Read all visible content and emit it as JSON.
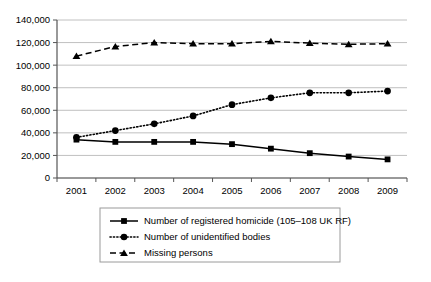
{
  "chart_data": {
    "type": "line",
    "title": "",
    "xlabel": "",
    "ylabel": "",
    "categories": [
      "2001",
      "2002",
      "2003",
      "2004",
      "2005",
      "2006",
      "2007",
      "2008",
      "2009"
    ],
    "ylim": [
      0,
      140000
    ],
    "ytick_values": [
      0,
      20000,
      40000,
      60000,
      80000,
      100000,
      120000,
      140000
    ],
    "ytick_labels": [
      "0",
      "20,000",
      "40,000",
      "60,000",
      "80,000",
      "100,000",
      "120,000",
      "140,000"
    ],
    "grid": true,
    "legend_position": "bottom",
    "series": [
      {
        "name": "Number of registered homicide (105–108 UK RF)",
        "marker": "square",
        "line_style": "solid",
        "color": "#000000",
        "values": [
          34000,
          32000,
          32000,
          32000,
          30000,
          26000,
          22000,
          19000,
          16500
        ]
      },
      {
        "name": "Number of unidentified bodies",
        "marker": "circle",
        "line_style": "dotted",
        "color": "#000000",
        "values": [
          36000,
          42000,
          48000,
          55000,
          65000,
          71000,
          75500,
          75500,
          77000
        ]
      },
      {
        "name": "Missing persons",
        "marker": "triangle",
        "line_style": "dashed",
        "color": "#000000",
        "values": [
          108000,
          116500,
          120000,
          119000,
          119000,
          121000,
          119500,
          118500,
          119000
        ]
      }
    ]
  },
  "legend": {
    "items": [
      {
        "label": "Number of registered homicide (105–108 UK RF)",
        "marker": "square",
        "line_style": "solid"
      },
      {
        "label": "Number of unidentified bodies",
        "marker": "circle",
        "line_style": "dotted"
      },
      {
        "label": "Missing persons",
        "marker": "triangle",
        "line_style": "dashed"
      }
    ]
  },
  "colors": {
    "ink": "#000000",
    "grid": "#b0b0b0",
    "axis": "#555555",
    "legend_border": "#9a9a9a",
    "background": "#ffffff"
  }
}
